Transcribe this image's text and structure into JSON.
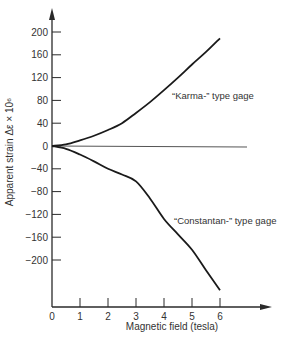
{
  "chart_data": {
    "type": "line",
    "title": "",
    "xlabel": "Magnetic field (tesla)",
    "ylabel": "Apparent strain Δε × 10⁶",
    "xlim": [
      0,
      7
    ],
    "ylim": [
      -260,
      220
    ],
    "x_ticks": [
      "0",
      "1",
      "2",
      "3",
      "4",
      "5",
      "6"
    ],
    "y_ticks": [
      "200",
      "160",
      "120",
      "80",
      "40",
      "0",
      "−40",
      "−80",
      "−120",
      "−160",
      "−200"
    ],
    "grid": false,
    "legend": "none (inline annotations)",
    "x": [
      0,
      0.5,
      1,
      1.5,
      2,
      2.5,
      3,
      3.5,
      4,
      4.5,
      5,
      5.5,
      6
    ],
    "series": [
      {
        "name": "“Karma-” type gage",
        "values": [
          0,
          3,
          10,
          18,
          28,
          40,
          58,
          77,
          98,
          120,
          143,
          165,
          189
        ]
      },
      {
        "name": "“Constantan-” type gage",
        "values": [
          0,
          -5,
          -15,
          -27,
          -40,
          -50,
          -62,
          -92,
          -128,
          -155,
          -182,
          -218,
          -253
        ]
      },
      {
        "name": "zero reference",
        "values": [
          0,
          0,
          0,
          0,
          0,
          0,
          0,
          0,
          0,
          0,
          0,
          0,
          0
        ]
      }
    ],
    "annotations": [
      {
        "text": "“Karma-” type gage",
        "near_x": 4.3,
        "near_y": 50
      },
      {
        "text": "“Constantan-” type gage",
        "near_x": 4.3,
        "near_y": -115
      }
    ]
  },
  "labels": {
    "x_axis_title": "Magnetic field (tesla)",
    "y_axis_title": "Apparent strain Δε × 10⁶",
    "karma": "“Karma-” type gage",
    "constantan": "“Constantan-” type gage"
  }
}
